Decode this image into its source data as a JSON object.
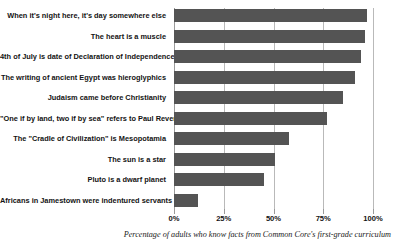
{
  "chart_data": {
    "type": "bar",
    "orientation": "horizontal",
    "title": "",
    "xlabel": "Percentage of adults who know facts from Common Core's first-grade curriculum",
    "ylabel": "",
    "xlim": [
      0,
      100
    ],
    "grid": true,
    "legend": null,
    "bar_color": "#545454",
    "gridline_color": "#b9b9b9",
    "xticks": [
      {
        "value": 0,
        "label": "0%"
      },
      {
        "value": 25,
        "label": "25%"
      },
      {
        "value": 50,
        "label": "50%"
      },
      {
        "value": 75,
        "label": "75%"
      },
      {
        "value": 100,
        "label": "100%"
      }
    ],
    "categories": [
      "When it's night here, it's day somewhere else",
      "The heart is a muscle",
      "4th of July is date of Declaration of Independence",
      "The writing of ancient Egypt was hieroglyphics",
      "Judaism came before Christianity",
      "\"One if by land, two if by sea\" refers to Paul Revere",
      "The \"Cradle of Civilization\" is Mesopotamia",
      "The sun is a star",
      "Pluto is a dwarf planet",
      "Africans in Jamestown were indentured servants"
    ],
    "values": [
      97,
      96,
      94,
      91,
      85,
      77,
      58,
      51,
      45,
      12
    ]
  }
}
